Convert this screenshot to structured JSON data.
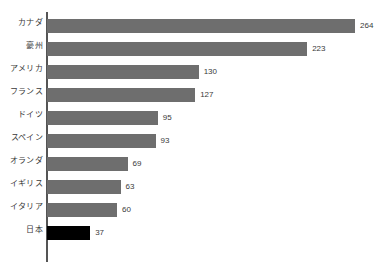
{
  "chart_data": {
    "type": "bar",
    "orientation": "horizontal",
    "title": "",
    "subtitle": "",
    "xlabel": "",
    "ylabel": "",
    "xlim": [
      0,
      264
    ],
    "grid": false,
    "legend": null,
    "categories": [
      "カナダ",
      "豪州",
      "アメリカ",
      "フランス",
      "ドイツ",
      "スペイン",
      "オランダ",
      "イギリス",
      "イタリア",
      "日本"
    ],
    "values": [
      264,
      223,
      130,
      127,
      95,
      93,
      69,
      63,
      60,
      37
    ],
    "value_labels": [
      "264",
      "223",
      "130",
      "127",
      "95",
      "93",
      "69",
      "63",
      "60",
      "37"
    ],
    "bars": [
      {
        "label": "カナダ",
        "value": 264,
        "value_label": "264",
        "color": "#6e6e6e",
        "highlighted": false
      },
      {
        "label": "豪州",
        "value": 223,
        "value_label": "223",
        "color": "#6e6e6e",
        "highlighted": false
      },
      {
        "label": "アメリカ",
        "value": 130,
        "value_label": "130",
        "color": "#6e6e6e",
        "highlighted": false
      },
      {
        "label": "フランス",
        "value": 127,
        "value_label": "127",
        "color": "#6e6e6e",
        "highlighted": false
      },
      {
        "label": "ドイツ",
        "value": 95,
        "value_label": "95",
        "color": "#6e6e6e",
        "highlighted": false
      },
      {
        "label": "スペイン",
        "value": 93,
        "value_label": "93",
        "color": "#6e6e6e",
        "highlighted": false
      },
      {
        "label": "オランダ",
        "value": 69,
        "value_label": "69",
        "color": "#6e6e6e",
        "highlighted": false
      },
      {
        "label": "イギリス",
        "value": 63,
        "value_label": "63",
        "color": "#6e6e6e",
        "highlighted": false
      },
      {
        "label": "イタリア",
        "value": 60,
        "value_label": "60",
        "color": "#6e6e6e",
        "highlighted": false
      },
      {
        "label": "日本",
        "value": 37,
        "value_label": "37",
        "color": "#000000",
        "highlighted": true
      }
    ],
    "colors": {
      "bar": "#6e6e6e",
      "highlight": "#000000",
      "axis": "#555555",
      "text": "#3a3a3a",
      "background": "#ffffff"
    }
  }
}
